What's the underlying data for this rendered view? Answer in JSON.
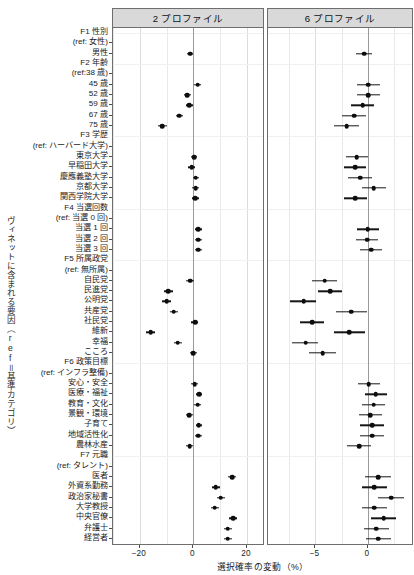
{
  "figure": {
    "x_axis_title": "選択確率の変動（%）",
    "y_axis_title": "ヴィネットに含まれる要因（ref＝基準カテゴリ）"
  },
  "panels": [
    {
      "id": "panelA",
      "label": "2 プロファイル"
    },
    {
      "id": "panelB",
      "label": "6 プロファイル"
    }
  ],
  "chart_data": {
    "type": "scatter",
    "title": "",
    "subtitle": "",
    "xlabel": "選択確率の変動（%）",
    "ylabel": "ヴィネットに含まれる要因（ref＝基準カテゴリ）",
    "grid": true,
    "legend": "none",
    "facets": [
      "2 プロファイル",
      "6 プロファイル"
    ],
    "facet_xlim": [
      [
        -30,
        26
      ],
      [
        -9.5,
        4.2
      ]
    ],
    "facet_xticks": [
      [
        -20,
        0,
        20
      ],
      [
        -5,
        0
      ]
    ],
    "groups": [
      {
        "header": "F1 性別",
        "reference": "(ref: 女性)",
        "levels": [
          {
            "label": "男性",
            "panel2": {
              "estimate": -1.2,
              "lower": -2.2,
              "upper": -0.2
            },
            "panel6": {
              "estimate": -0.35,
              "lower": -1.1,
              "upper": 0.35
            }
          }
        ]
      },
      {
        "header": "F2 年齢",
        "reference": "(ref:38 歳)",
        "levels": [
          {
            "label": "45 歳",
            "panel2": {
              "estimate": 1.6,
              "lower": 0.4,
              "upper": 3.0
            },
            "panel6": {
              "estimate": 0.05,
              "lower": -1.05,
              "upper": 1.15
            }
          },
          {
            "label": "52 歳",
            "panel2": {
              "estimate": -2.3,
              "lower": -3.5,
              "upper": -1.0
            },
            "panel6": {
              "estimate": 0.05,
              "lower": -1.05,
              "upper": 1.2
            }
          },
          {
            "label": "59 歳",
            "panel2": {
              "estimate": -1.5,
              "lower": -2.8,
              "upper": -0.2
            },
            "panel6": {
              "estimate": -0.5,
              "lower": -1.6,
              "upper": 0.6
            }
          },
          {
            "label": "67 歳",
            "panel2": {
              "estimate": -5.3,
              "lower": -6.6,
              "upper": -4.0
            },
            "panel6": {
              "estimate": -1.3,
              "lower": -2.5,
              "upper": -0.2
            }
          },
          {
            "label": "75 歳",
            "panel2": {
              "estimate": -11.7,
              "lower": -13.3,
              "upper": -10.0
            },
            "panel6": {
              "estimate": -2.0,
              "lower": -3.2,
              "upper": -0.85
            }
          }
        ]
      },
      {
        "header": "F3 学歴",
        "reference": "(ref: ハーバード大学)",
        "levels": [
          {
            "label": "東京大学",
            "panel2": {
              "estimate": 0.35,
              "lower": -0.8,
              "upper": 1.5
            },
            "panel6": {
              "estimate": -1.05,
              "lower": -2.1,
              "upper": 0.05
            }
          },
          {
            "label": "早稲田大学",
            "panel2": {
              "estimate": -0.6,
              "lower": -1.9,
              "upper": 0.7
            },
            "panel6": {
              "estimate": -1.2,
              "lower": -2.3,
              "upper": -0.15
            }
          },
          {
            "label": "慶應義塾大学",
            "panel2": {
              "estimate": 0.9,
              "lower": -0.2,
              "upper": 2.1
            },
            "panel6": {
              "estimate": -0.75,
              "lower": -1.85,
              "upper": 0.35
            }
          },
          {
            "label": "京都大学",
            "panel2": {
              "estimate": 0.8,
              "lower": -0.35,
              "upper": 1.95
            },
            "panel6": {
              "estimate": 0.55,
              "lower": -0.6,
              "upper": 1.7
            }
          },
          {
            "label": "関西学院大学",
            "panel2": {
              "estimate": 0.75,
              "lower": -0.5,
              "upper": 2.0
            },
            "panel6": {
              "estimate": -1.2,
              "lower": -2.3,
              "upper": -0.1
            }
          }
        ]
      },
      {
        "header": "F4 当選回数",
        "reference": "(ref: 当選 0 回)",
        "levels": [
          {
            "label": "当選 1 回",
            "panel2": {
              "estimate": 1.9,
              "lower": 0.7,
              "upper": 3.1
            },
            "panel6": {
              "estimate": 0.0,
              "lower": -1.05,
              "upper": 1.05
            }
          },
          {
            "label": "当選 2 回",
            "panel2": {
              "estimate": 1.85,
              "lower": 0.6,
              "upper": 3.05
            },
            "panel6": {
              "estimate": -0.05,
              "lower": -1.1,
              "upper": 1.0
            }
          },
          {
            "label": "当選 3 回",
            "panel2": {
              "estimate": 1.9,
              "lower": 0.7,
              "upper": 3.15
            },
            "panel6": {
              "estimate": 0.3,
              "lower": -0.7,
              "upper": 1.35
            }
          }
        ]
      },
      {
        "header": "F5 所属政党",
        "reference": "(ref: 無所属)",
        "levels": [
          {
            "label": "自民党",
            "panel2": {
              "estimate": -1.1,
              "lower": -2.6,
              "upper": 0.4
            },
            "panel6": {
              "estimate": -4.1,
              "lower": -5.3,
              "upper": -2.9
            }
          },
          {
            "label": "民進党",
            "panel2": {
              "estimate": -9.3,
              "lower": -10.9,
              "upper": -7.7
            },
            "panel6": {
              "estimate": -3.6,
              "lower": -4.7,
              "upper": -2.5
            }
          },
          {
            "label": "公明党",
            "panel2": {
              "estimate": -9.9,
              "lower": -11.6,
              "upper": -8.2
            },
            "panel6": {
              "estimate": -6.1,
              "lower": -7.4,
              "upper": -4.9
            }
          },
          {
            "label": "共産党",
            "panel2": {
              "estimate": -7.4,
              "lower": -8.9,
              "upper": -5.9
            },
            "panel6": {
              "estimate": -1.6,
              "lower": -3.0,
              "upper": -0.1
            }
          },
          {
            "label": "社民党",
            "panel2": {
              "estimate": 0.6,
              "lower": -0.7,
              "upper": 1.9
            },
            "panel6": {
              "estimate": -5.3,
              "lower": -6.5,
              "upper": -4.2
            }
          },
          {
            "label": "維新",
            "panel2": {
              "estimate": -16.0,
              "lower": -17.8,
              "upper": -14.2
            },
            "panel6": {
              "estimate": -1.75,
              "lower": -3.2,
              "upper": -0.3
            }
          },
          {
            "label": "幸福",
            "panel2": {
              "estimate": -5.9,
              "lower": -7.4,
              "upper": -4.4
            },
            "panel6": {
              "estimate": -5.9,
              "lower": -7.2,
              "upper": -4.7
            }
          },
          {
            "label": "こころ",
            "panel2": {
              "estimate": 0.0,
              "lower": -1.3,
              "upper": 1.3
            },
            "panel6": {
              "estimate": -4.3,
              "lower": -5.6,
              "upper": -3.0
            }
          }
        ]
      },
      {
        "header": "F6 政策目標",
        "reference": "(ref: インフラ整備)",
        "levels": [
          {
            "label": "安心・安全",
            "panel2": {
              "estimate": 0.5,
              "lower": -0.7,
              "upper": 1.7
            },
            "panel6": {
              "estimate": 0.1,
              "lower": -0.95,
              "upper": 1.2
            }
          },
          {
            "label": "医療・福祉",
            "panel2": {
              "estimate": 2.2,
              "lower": 1.0,
              "upper": 3.4
            },
            "panel6": {
              "estimate": 0.75,
              "lower": -0.3,
              "upper": 1.85
            }
          },
          {
            "label": "教育・文化",
            "panel2": {
              "estimate": 1.6,
              "lower": 0.4,
              "upper": 2.8
            },
            "panel6": {
              "estimate": 0.55,
              "lower": -0.55,
              "upper": 1.65
            }
          },
          {
            "label": "景観・環境",
            "panel2": {
              "estimate": -1.6,
              "lower": -2.9,
              "upper": -0.3
            },
            "panel6": {
              "estimate": 0.2,
              "lower": -0.85,
              "upper": 1.3
            }
          },
          {
            "label": "子育て",
            "panel2": {
              "estimate": 2.0,
              "lower": 0.8,
              "upper": 3.2
            },
            "panel6": {
              "estimate": 0.4,
              "lower": -0.7,
              "upper": 1.5
            }
          },
          {
            "label": "地域活性化",
            "panel2": {
              "estimate": 1.9,
              "lower": 0.7,
              "upper": 3.1
            },
            "panel6": {
              "estimate": 0.4,
              "lower": -0.7,
              "upper": 1.5
            }
          },
          {
            "label": "農林水産",
            "panel2": {
              "estimate": -1.4,
              "lower": -2.7,
              "upper": -0.1
            },
            "panel6": {
              "estimate": -0.85,
              "lower": -2.0,
              "upper": 0.3
            }
          }
        ]
      },
      {
        "header": "F7 元職",
        "reference": "(ref: タレント)",
        "levels": [
          {
            "label": "医者",
            "panel2": {
              "estimate": 14.5,
              "lower": 13.0,
              "upper": 16.0
            },
            "panel6": {
              "estimate": 1.0,
              "lower": -0.25,
              "upper": 2.25
            }
          },
          {
            "label": "外資系勤務",
            "panel2": {
              "estimate": 8.4,
              "lower": 6.9,
              "upper": 9.9
            },
            "panel6": {
              "estimate": 0.6,
              "lower": -0.6,
              "upper": 1.85
            }
          },
          {
            "label": "政治家秘書",
            "panel2": {
              "estimate": 10.2,
              "lower": 8.7,
              "upper": 11.7
            },
            "panel6": {
              "estimate": 2.2,
              "lower": 1.0,
              "upper": 3.4
            }
          },
          {
            "label": "大学教授",
            "panel2": {
              "estimate": 8.0,
              "lower": 6.5,
              "upper": 9.5
            },
            "panel6": {
              "estimate": 0.6,
              "lower": -0.6,
              "upper": 1.85
            }
          },
          {
            "label": "中央官僚",
            "panel2": {
              "estimate": 14.9,
              "lower": 13.4,
              "upper": 16.4
            },
            "panel6": {
              "estimate": 1.5,
              "lower": 0.3,
              "upper": 2.7
            }
          },
          {
            "label": "弁護士",
            "panel2": {
              "estimate": 12.8,
              "lower": 11.3,
              "upper": 14.3
            },
            "panel6": {
              "estimate": 0.8,
              "lower": -0.4,
              "upper": 2.05
            }
          },
          {
            "label": "経営者",
            "panel2": {
              "estimate": 12.8,
              "lower": 11.3,
              "upper": 14.3
            },
            "panel6": {
              "estimate": 1.0,
              "lower": -0.2,
              "upper": 2.2
            }
          }
        ]
      }
    ]
  }
}
